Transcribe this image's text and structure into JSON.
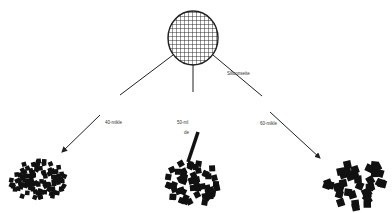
{
  "diagram": {
    "top_node": {
      "label": "Siliconseite",
      "icon": "mesh-sieve-circle"
    },
    "branches": [
      {
        "label": "40-mikle",
        "result": "fine-particle-cluster"
      },
      {
        "label_line1": "50-ml",
        "label_line2": "de",
        "result": "medium-particle-cluster-with-rod"
      },
      {
        "label": "60-mikle",
        "result": "coarse-particle-cluster"
      }
    ],
    "colors": {
      "line": "#222222",
      "particle": "#111111",
      "mesh": "#1a1a1a"
    }
  }
}
